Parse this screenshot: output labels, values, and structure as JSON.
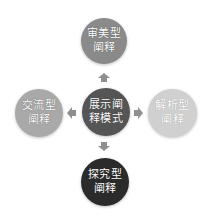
{
  "diagram": {
    "center": {
      "line1": "展示阐",
      "line2": "释模式",
      "color": "#555555"
    },
    "top": {
      "line1": "审美型",
      "line2": "阐释",
      "color": "#8a8a8a"
    },
    "left": {
      "line1": "交流型",
      "line2": "阐释",
      "color": "#a9a9a9"
    },
    "right": {
      "line1": "解析型",
      "line2": "阐释",
      "color": "#d0d0d0"
    },
    "bottom": {
      "line1": "探究型",
      "line2": "阐释",
      "color": "#2b2b2b"
    },
    "arrow_color": "#8f8f8f"
  }
}
